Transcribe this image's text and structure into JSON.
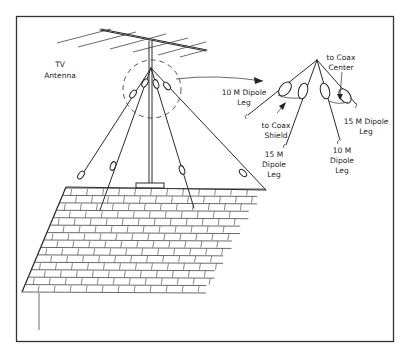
{
  "figure": {
    "labels": {
      "tv_antenna_line1": "TV",
      "tv_antenna_line2": "Antenna",
      "ten_m_leg_left_line1": "10 M Dipole",
      "ten_m_leg_left_line2": "Leg",
      "coax_shield_line1": "to Coax",
      "coax_shield_line2": "Shield",
      "fifteen_m_leg_left_line1": "15 M",
      "fifteen_m_leg_left_line2": "Dipole",
      "fifteen_m_leg_left_line3": "Leg",
      "coax_center_line1": "to Coax",
      "coax_center_line2": "Center",
      "fifteen_m_leg_right_line1": "15 M Dipole",
      "fifteen_m_leg_right_line2": "Leg",
      "ten_m_leg_right_line1": "10 M",
      "ten_m_leg_right_line2": "Dipole",
      "ten_m_leg_right_line3": "Leg"
    },
    "colors": {
      "line": "#2a2a2a",
      "background": "#ffffff",
      "frame": "#333333"
    }
  }
}
